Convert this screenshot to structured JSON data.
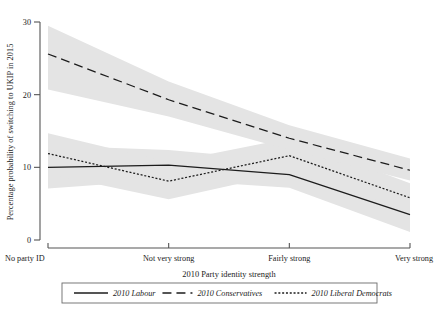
{
  "chart_data": {
    "type": "line",
    "title": "",
    "xlabel": "2010 Party identity strength",
    "ylabel": "Percentage probability of switching to UKIP in 2015",
    "categories": [
      "No party ID",
      "Not very strong",
      "Fairly strong",
      "Very strong"
    ],
    "x": [
      0,
      1,
      2,
      3
    ],
    "xlim": [
      -0.06,
      3.06
    ],
    "ylim": [
      0,
      30
    ],
    "yticks": [
      0,
      10,
      20,
      30
    ],
    "ytick_labels": [
      "0",
      "10",
      "20",
      "30"
    ],
    "grid": false,
    "legend_position": "bottom",
    "band_color": "#e4e4e4",
    "line_color": "#1c1c1c",
    "series": [
      {
        "name": "2010 Labour",
        "style": "solid",
        "values": [
          10.0,
          10.3,
          9.0,
          3.5
        ],
        "ci_lower": [
          7.1,
          8.3,
          7.2,
          1.1
        ],
        "ci_upper": [
          13.0,
          12.4,
          10.9,
          6.0
        ]
      },
      {
        "name": "2010 Conservatives",
        "style": "dashed",
        "values": [
          25.6,
          19.3,
          14.0,
          9.6
        ],
        "ci_lower": [
          20.7,
          17.0,
          12.4,
          8.2
        ],
        "ci_upper": [
          29.5,
          21.8,
          15.8,
          11.2
        ]
      },
      {
        "name": "2010 Liberal Democrats",
        "style": "dotted",
        "values": [
          11.9,
          8.1,
          11.6,
          5.8
        ],
        "ci_lower": [
          9.1,
          5.6,
          9.3,
          4.0
        ],
        "ci_upper": [
          14.7,
          10.7,
          14.0,
          7.8
        ]
      }
    ]
  },
  "legend": {
    "items": [
      {
        "label": "2010 Labour",
        "style": "solid"
      },
      {
        "label": "2010 Conservatives",
        "style": "dashed"
      },
      {
        "label": "2010 Liberal Democrats",
        "style": "dotted"
      }
    ]
  }
}
